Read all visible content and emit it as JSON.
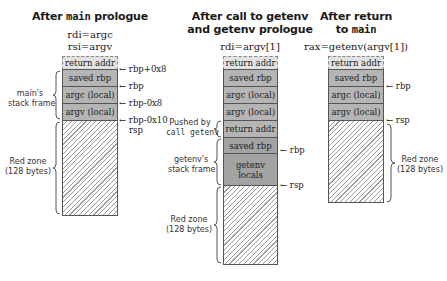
{
  "diagram": {
    "colors": {
      "cell_fill": "#b5b5b5",
      "cell_fill_dark": "#a3a3a3",
      "return_addr_fill": "#e2e2e2",
      "hatch_line": "#9a9a9a",
      "border": "#555555"
    },
    "panels": [
      {
        "title_line1_prefix": "After ",
        "title_line1_code": "main",
        "title_line1_suffix": " prologue",
        "registers": [
          "rdi=argc",
          "rsi=argv"
        ],
        "cells": [
          "return addr",
          "saved rbp",
          "argc (local)",
          "argv (local)"
        ],
        "pointers": [
          "rbp+0x8",
          "rbp",
          "rbp-0x8",
          "rbp-0x10",
          "rsp"
        ],
        "braces": [
          "main's\nstack frame",
          "Red zone\n(128 bytes)"
        ],
        "brace_labels": [
          {
            "line1": "main's",
            "line2": "stack frame"
          },
          {
            "line1": "Red zone",
            "line2": "(128 bytes)"
          }
        ]
      },
      {
        "title_line1": "After call to getenv",
        "title_line2": "and getenv prologue",
        "registers": [
          "rdi=argv[1]"
        ],
        "cells": [
          "return addr",
          "saved rbp",
          "argc (local)",
          "argv (local)",
          "return addr",
          "saved rbp",
          "getenv",
          "locals"
        ],
        "pointers": [
          "rbp",
          "rsp"
        ],
        "brace_labels": [
          {
            "line1": "Pushed by",
            "line2_code": "call getenv"
          },
          {
            "line1": "getenv's",
            "line2": "stack frame"
          },
          {
            "line1": "Red zone",
            "line2": "(128 bytes)"
          }
        ]
      },
      {
        "title_line1": "After return",
        "title_line2_prefix": "to ",
        "title_line2_code": "main",
        "registers": [
          "rax=getenv(argv[1])"
        ],
        "cells": [
          "return addr",
          "saved rbp",
          "argc (local)",
          "argv (local)"
        ],
        "pointers": [
          "rbp",
          "rsp"
        ],
        "brace_labels": [
          {
            "line1": "Red zone",
            "line2": "(128 bytes)"
          }
        ]
      }
    ]
  }
}
